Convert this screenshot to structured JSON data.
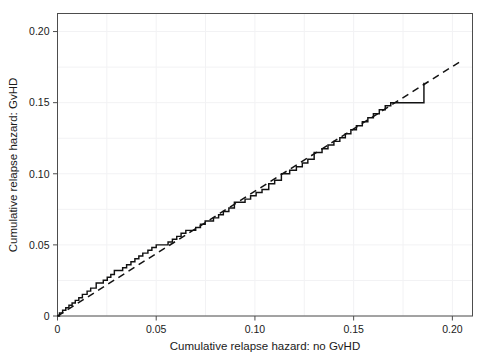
{
  "chart_data": {
    "type": "line",
    "title": "",
    "xlabel": "Cumulative relapse hazard: no GvHD",
    "ylabel": "Cumulative relapse hazard: GvHD",
    "xlim": [
      0,
      0.2102
    ],
    "ylim": [
      0,
      0.2127
    ],
    "xticks": [
      0,
      0.05,
      0.1,
      0.15,
      0.2
    ],
    "xticklabels": [
      "0",
      "0.05",
      "0.10",
      "0.15",
      "0.20"
    ],
    "yticks": [
      0,
      0.05,
      0.1,
      0.15,
      0.2
    ],
    "yticklabels": [
      "0",
      "0.05",
      "0.10",
      "0.15",
      "0.20"
    ],
    "grid": true,
    "legend": "none",
    "series": [
      {
        "name": "reference-diagonal",
        "style": "dashed",
        "type": "line",
        "x": [
          0,
          0.2035
        ],
        "y": [
          0,
          0.1785
        ]
      },
      {
        "name": "cumulative-hazard-step",
        "style": "solid",
        "type": "step",
        "points": [
          [
            0.0,
            0.0
          ],
          [
            0.001,
            0.0
          ],
          [
            0.001,
            0.0022
          ],
          [
            0.0026,
            0.0022
          ],
          [
            0.0026,
            0.0041
          ],
          [
            0.0042,
            0.0041
          ],
          [
            0.0042,
            0.0058
          ],
          [
            0.0058,
            0.0058
          ],
          [
            0.0058,
            0.0075
          ],
          [
            0.0074,
            0.0075
          ],
          [
            0.0074,
            0.0092
          ],
          [
            0.009,
            0.0092
          ],
          [
            0.009,
            0.011
          ],
          [
            0.0108,
            0.011
          ],
          [
            0.0108,
            0.0128
          ],
          [
            0.0126,
            0.0128
          ],
          [
            0.0126,
            0.0152
          ],
          [
            0.015,
            0.0152
          ],
          [
            0.015,
            0.0175
          ],
          [
            0.0168,
            0.0175
          ],
          [
            0.0168,
            0.0196
          ],
          [
            0.0196,
            0.0196
          ],
          [
            0.0196,
            0.0232
          ],
          [
            0.0232,
            0.0232
          ],
          [
            0.0232,
            0.0252
          ],
          [
            0.0252,
            0.0252
          ],
          [
            0.0252,
            0.0272
          ],
          [
            0.027,
            0.0272
          ],
          [
            0.027,
            0.0292
          ],
          [
            0.0288,
            0.0292
          ],
          [
            0.0288,
            0.032
          ],
          [
            0.033,
            0.032
          ],
          [
            0.033,
            0.034
          ],
          [
            0.035,
            0.034
          ],
          [
            0.035,
            0.036
          ],
          [
            0.0372,
            0.036
          ],
          [
            0.0372,
            0.0382
          ],
          [
            0.0392,
            0.0382
          ],
          [
            0.0392,
            0.0402
          ],
          [
            0.0412,
            0.0402
          ],
          [
            0.0412,
            0.0422
          ],
          [
            0.0432,
            0.0422
          ],
          [
            0.0432,
            0.0442
          ],
          [
            0.0458,
            0.0442
          ],
          [
            0.0458,
            0.0462
          ],
          [
            0.0478,
            0.0462
          ],
          [
            0.0478,
            0.0482
          ],
          [
            0.05,
            0.0482
          ],
          [
            0.05,
            0.05
          ],
          [
            0.056,
            0.05
          ],
          [
            0.056,
            0.052
          ],
          [
            0.0582,
            0.052
          ],
          [
            0.0582,
            0.054
          ],
          [
            0.0604,
            0.054
          ],
          [
            0.0604,
            0.056
          ],
          [
            0.0626,
            0.056
          ],
          [
            0.0626,
            0.0582
          ],
          [
            0.065,
            0.0582
          ],
          [
            0.065,
            0.0602
          ],
          [
            0.07,
            0.0602
          ],
          [
            0.07,
            0.0622
          ],
          [
            0.0724,
            0.0622
          ],
          [
            0.0724,
            0.0645
          ],
          [
            0.0748,
            0.0645
          ],
          [
            0.0748,
            0.0668
          ],
          [
            0.079,
            0.0668
          ],
          [
            0.079,
            0.069
          ],
          [
            0.0816,
            0.069
          ],
          [
            0.0816,
            0.0712
          ],
          [
            0.084,
            0.0712
          ],
          [
            0.084,
            0.0735
          ],
          [
            0.0868,
            0.0735
          ],
          [
            0.0868,
            0.076
          ],
          [
            0.0896,
            0.076
          ],
          [
            0.0896,
            0.08
          ],
          [
            0.095,
            0.08
          ],
          [
            0.095,
            0.0822
          ],
          [
            0.0978,
            0.0822
          ],
          [
            0.0978,
            0.0845
          ],
          [
            0.1006,
            0.0845
          ],
          [
            0.1006,
            0.0868
          ],
          [
            0.1036,
            0.0868
          ],
          [
            0.1036,
            0.089
          ],
          [
            0.107,
            0.089
          ],
          [
            0.107,
            0.093
          ],
          [
            0.11,
            0.093
          ],
          [
            0.11,
            0.0955
          ],
          [
            0.1134,
            0.0955
          ],
          [
            0.1134,
            0.1
          ],
          [
            0.1176,
            0.1
          ],
          [
            0.1176,
            0.1025
          ],
          [
            0.121,
            0.1025
          ],
          [
            0.121,
            0.105
          ],
          [
            0.124,
            0.105
          ],
          [
            0.124,
            0.1076
          ],
          [
            0.1268,
            0.1076
          ],
          [
            0.1268,
            0.1102
          ],
          [
            0.13,
            0.1102
          ],
          [
            0.13,
            0.115
          ],
          [
            0.134,
            0.115
          ],
          [
            0.134,
            0.1176
          ],
          [
            0.137,
            0.1176
          ],
          [
            0.137,
            0.1202
          ],
          [
            0.14,
            0.1202
          ],
          [
            0.14,
            0.1228
          ],
          [
            0.143,
            0.1228
          ],
          [
            0.143,
            0.1254
          ],
          [
            0.1458,
            0.1254
          ],
          [
            0.1458,
            0.1282
          ],
          [
            0.1486,
            0.1282
          ],
          [
            0.1486,
            0.131
          ],
          [
            0.1514,
            0.131
          ],
          [
            0.1514,
            0.1338
          ],
          [
            0.1544,
            0.1338
          ],
          [
            0.1544,
            0.1366
          ],
          [
            0.1572,
            0.1366
          ],
          [
            0.1572,
            0.1394
          ],
          [
            0.16,
            0.1394
          ],
          [
            0.16,
            0.1422
          ],
          [
            0.163,
            0.1422
          ],
          [
            0.163,
            0.145
          ],
          [
            0.166,
            0.145
          ],
          [
            0.166,
            0.1478
          ],
          [
            0.1688,
            0.1478
          ],
          [
            0.1688,
            0.15
          ],
          [
            0.1856,
            0.15
          ],
          [
            0.1856,
            0.164
          ]
        ]
      }
    ]
  }
}
